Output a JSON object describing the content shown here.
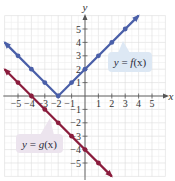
{
  "chart_data": {
    "type": "line",
    "title": "",
    "xlabel": "x",
    "ylabel": "y",
    "xlim": [
      -6,
      6
    ],
    "ylim": [
      -6,
      6
    ],
    "grid": true,
    "x_ticks": [
      -5,
      -4,
      -3,
      -2,
      -1,
      1,
      2,
      3,
      4,
      5
    ],
    "y_ticks": [
      -5,
      -4,
      -3,
      -2,
      -1,
      1,
      2,
      3,
      4,
      5
    ],
    "series": [
      {
        "name": "y = f(x)",
        "color": "#4a5fa8",
        "x": [
          -5,
          -4,
          -3,
          -2,
          -1,
          0,
          1,
          2,
          3
        ],
        "y": [
          3,
          2,
          1,
          0,
          1,
          2,
          3,
          4,
          5
        ],
        "line_extent": [
          [
            -6,
            4
          ],
          [
            -2,
            0
          ],
          [
            4,
            6
          ]
        ]
      },
      {
        "name": "y = g(x)",
        "color": "#8a1c3c",
        "x": [
          -5,
          -4,
          -3,
          -2,
          -1,
          0,
          1
        ],
        "y": [
          1,
          0,
          -1,
          -2,
          -3,
          -4,
          -5
        ],
        "line_extent": [
          [
            -6,
            2
          ],
          [
            2,
            -6
          ]
        ]
      }
    ],
    "annotations": [
      {
        "text": "y = f(x)",
        "box_color": "#dde8f4"
      },
      {
        "text": "y = g(x)",
        "box_color": "#ece4ee"
      }
    ]
  },
  "labels": {
    "f": {
      "y": "y",
      "eq": " = ",
      "fn": "f",
      "arg": "(x)"
    },
    "g": {
      "y": "y",
      "eq": " = ",
      "fn": "g",
      "arg": "(x)"
    }
  }
}
